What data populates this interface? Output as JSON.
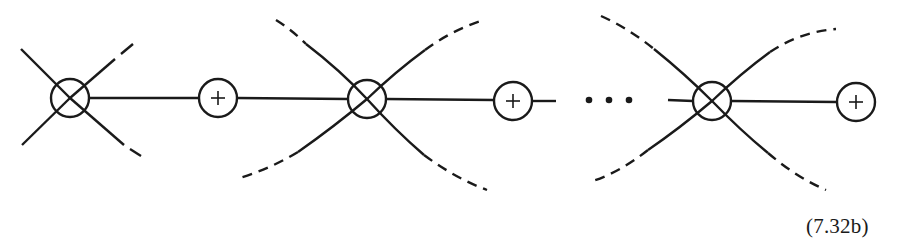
{
  "diagram": {
    "equation_label": "(7.32b)",
    "stroke_color": "#1a1a1a",
    "background": "#ffffff",
    "ellipsis": "• • •",
    "nodes": [
      {
        "id": "vertex-1",
        "type": "crossed-circle",
        "cx": 70,
        "cy": 98
      },
      {
        "id": "plus-1",
        "type": "plus-circle",
        "cx": 218,
        "cy": 98
      },
      {
        "id": "vertex-2",
        "type": "crossed-circle",
        "cx": 367,
        "cy": 99
      },
      {
        "id": "plus-2",
        "type": "plus-circle",
        "cx": 513,
        "cy": 101
      },
      {
        "id": "ellipsis",
        "type": "dots",
        "x": [
          589,
          609,
          629
        ],
        "y": 100
      },
      {
        "id": "vertex-3",
        "type": "crossed-circle",
        "cx": 712,
        "cy": 101
      },
      {
        "id": "plus-3",
        "type": "plus-circle",
        "cx": 856,
        "cy": 102
      }
    ]
  }
}
